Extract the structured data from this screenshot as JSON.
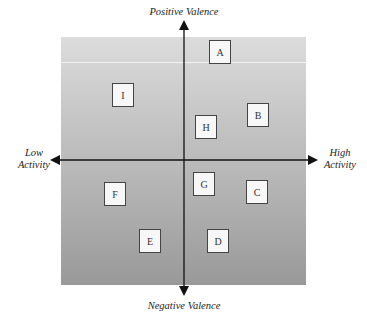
{
  "diagram": {
    "type": "two-axis affect grid",
    "axes": {
      "vertical": {
        "top_label": "Positive Valence",
        "bottom_label": "Negative Valence"
      },
      "horizontal": {
        "left_label_line1": "Low",
        "left_label_line2": "Activity",
        "right_label_line1": "High",
        "right_label_line2": "Activity"
      }
    },
    "boxes": [
      {
        "label": "A",
        "quadrant": "positive-high",
        "x": 209,
        "y": 40
      },
      {
        "label": "B",
        "quadrant": "positive-high",
        "x": 247,
        "y": 103
      },
      {
        "label": "C",
        "quadrant": "negative-high",
        "x": 246,
        "y": 180
      },
      {
        "label": "D",
        "quadrant": "negative-high",
        "x": 207,
        "y": 229
      },
      {
        "label": "E",
        "quadrant": "negative-low",
        "x": 139,
        "y": 229
      },
      {
        "label": "F",
        "quadrant": "negative-low",
        "x": 104,
        "y": 182
      },
      {
        "label": "G",
        "quadrant": "negative-high",
        "x": 193,
        "y": 172
      },
      {
        "label": "H",
        "quadrant": "positive-high",
        "x": 195,
        "y": 115
      },
      {
        "label": "I",
        "quadrant": "positive-low",
        "x": 112,
        "y": 83
      }
    ],
    "colors": {
      "background_top": "#dcdcdc",
      "background_bottom": "#999999",
      "axis": "#111111",
      "box_fill": "#f7f7f7",
      "box_border": "#444444"
    }
  }
}
